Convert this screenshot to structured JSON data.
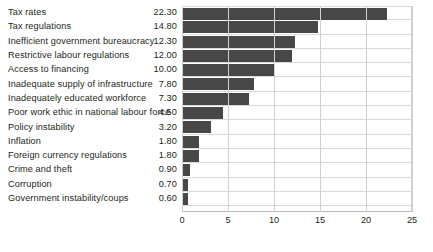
{
  "chart_data": {
    "type": "bar",
    "orientation": "horizontal",
    "title": "",
    "xlabel": "",
    "ylabel": "",
    "xlim": [
      0,
      25
    ],
    "xticks": [
      "0",
      "5",
      "10",
      "15",
      "20",
      "25"
    ],
    "grid": true,
    "legend": "none",
    "bar_color": "#474747",
    "gridline_color": "#d0d0d0",
    "categories": [
      "Tax rates",
      "Tax regulations",
      "Inefficient government bureaucracy",
      "Restrictive labour regulations",
      "Access to financing",
      "Inadequate supply of infrastructure",
      "Inadequately educated workforce",
      "Poor work ethic in national labour force",
      "Policy instability",
      "Inflation",
      "Foreign currency regulations",
      "Crime and theft",
      "Corruption",
      "Government instability/coups"
    ],
    "values": [
      22.3,
      14.8,
      12.3,
      12.0,
      10.0,
      7.8,
      7.3,
      4.5,
      3.2,
      1.8,
      1.8,
      0.9,
      0.7,
      0.6
    ],
    "value_labels": [
      "22.30",
      "14.80",
      "12.30",
      "12.00",
      "10.00",
      "7.80",
      "7.30",
      "4.50",
      "3.20",
      "1.80",
      "1.80",
      "0.90",
      "0.70",
      "0.60"
    ],
    "rows": [
      {
        "label": "Tax rates",
        "value": "22.30",
        "num": 22.3
      },
      {
        "label": "Tax regulations",
        "value": "14.80",
        "num": 14.8
      },
      {
        "label": "Inefficient government bureaucracy",
        "value": "12.30",
        "num": 12.3
      },
      {
        "label": "Restrictive labour regulations",
        "value": "12.00",
        "num": 12.0
      },
      {
        "label": "Access to financing",
        "value": "10.00",
        "num": 10.0
      },
      {
        "label": "Inadequate supply of infrastructure",
        "value": "7.80",
        "num": 7.8
      },
      {
        "label": "Inadequately educated workforce",
        "value": "7.30",
        "num": 7.3
      },
      {
        "label": "Poor work ethic in national labour force",
        "value": "4.50",
        "num": 4.5
      },
      {
        "label": "Policy instability",
        "value": "3.20",
        "num": 3.2
      },
      {
        "label": "Inflation",
        "value": "1.80",
        "num": 1.8
      },
      {
        "label": "Foreign currency regulations",
        "value": "1.80",
        "num": 1.8
      },
      {
        "label": "Crime and theft",
        "value": "0.90",
        "num": 0.9
      },
      {
        "label": "Corruption",
        "value": "0.70",
        "num": 0.7
      },
      {
        "label": "Government instability/coups",
        "value": "0.60",
        "num": 0.6
      }
    ]
  }
}
